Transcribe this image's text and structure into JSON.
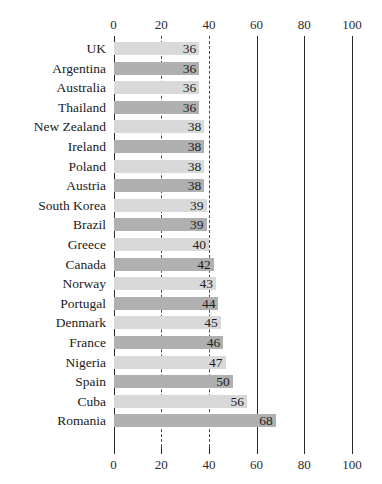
{
  "chart_data": {
    "type": "bar",
    "orientation": "horizontal",
    "title": "",
    "xlabel": "",
    "ylabel": "",
    "xlim": [
      0,
      100
    ],
    "xticks": [
      0,
      20,
      40,
      60,
      80,
      100
    ],
    "xtick_labels": [
      "0",
      "20",
      "40",
      "60",
      "80",
      "100"
    ],
    "grid": true,
    "grid_axis": "x",
    "legend": "none",
    "axis_top_labels": [
      "0",
      "20",
      "40",
      "60",
      "80",
      "100"
    ],
    "axis_bottom_labels": [
      "0",
      "20",
      "40",
      "60",
      "80",
      "100"
    ],
    "categories": [
      "UK",
      "Argentina",
      "Australia",
      "Thailand",
      "New Zealand",
      "Ireland",
      "Poland",
      "Austria",
      "South Korea",
      "Brazil",
      "Greece",
      "Canada",
      "Norway",
      "Portugal",
      "Denmark",
      "France",
      "Nigeria",
      "Spain",
      "Cuba",
      "Romania"
    ],
    "values": [
      36,
      36,
      36,
      36,
      38,
      38,
      38,
      38,
      39,
      39,
      40,
      42,
      43,
      44,
      45,
      46,
      47,
      50,
      56,
      68
    ],
    "value_labels": [
      "36",
      "36",
      "36",
      "36",
      "38",
      "38",
      "38",
      "38",
      "39",
      "39",
      "40",
      "42",
      "43",
      "44",
      "45",
      "46",
      "47",
      "50",
      "56",
      "68"
    ],
    "bar_styles": [
      "light",
      "dark",
      "light",
      "dark",
      "light",
      "dark",
      "light",
      "dark",
      "light",
      "dark",
      "light",
      "dark",
      "light",
      "dark",
      "light",
      "dark",
      "light",
      "dark",
      "light",
      "dark"
    ],
    "colors": {
      "bar_light": "#d9d9d9",
      "bar_dark": "#b0b0b0",
      "gridline_solid": "#2a2a2a",
      "gridline_dashed": "#4a4a4a",
      "text": "#1a1a1a",
      "background": "#ffffff"
    }
  }
}
